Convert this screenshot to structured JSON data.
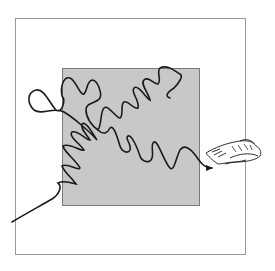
{
  "diagram": {
    "type": "random-walk-illustration",
    "outer_region": {
      "x": 15,
      "y": 18,
      "width": 231,
      "height": 237,
      "stroke": "#9a9a9a",
      "fill": "#ffffff"
    },
    "inner_region": {
      "x": 62,
      "y": 68,
      "width": 138,
      "height": 138,
      "stroke": "#7a7a7a",
      "fill": "#c8c8c8"
    },
    "path": {
      "stroke": "#1a1a1a",
      "start": [
        12,
        222
      ],
      "end": [
        212,
        168
      ],
      "arrowhead": "end"
    },
    "shell": {
      "icon": "shell-icon",
      "x": 205,
      "y": 140,
      "width": 60,
      "height": 26
    }
  }
}
